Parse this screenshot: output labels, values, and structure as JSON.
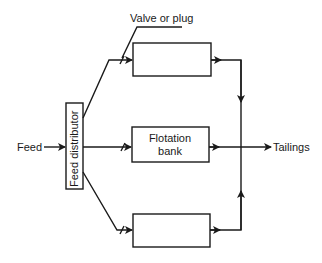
{
  "diagram": {
    "type": "flowsheet",
    "labels": {
      "feed": "Feed",
      "distributor": "Feed distributor",
      "valve": "Valve or plug",
      "bank_line1": "Flotation",
      "bank_line2": "bank",
      "tailings": "Tailings"
    },
    "nodes": [
      {
        "id": "feed",
        "label": "Feed"
      },
      {
        "id": "distributor",
        "label": "Feed distributor"
      },
      {
        "id": "bank_top",
        "label": ""
      },
      {
        "id": "bank_middle",
        "label": "Flotation bank"
      },
      {
        "id": "bank_bottom",
        "label": ""
      },
      {
        "id": "tailings",
        "label": "Tailings"
      }
    ],
    "edges": [
      {
        "from": "feed",
        "to": "distributor"
      },
      {
        "from": "distributor",
        "to": "bank_top",
        "via": "valve"
      },
      {
        "from": "distributor",
        "to": "bank_middle",
        "via": "valve"
      },
      {
        "from": "distributor",
        "to": "bank_bottom",
        "via": "valve"
      },
      {
        "from": "bank_top",
        "to": "tailings"
      },
      {
        "from": "bank_middle",
        "to": "tailings"
      },
      {
        "from": "bank_bottom",
        "to": "tailings"
      }
    ],
    "colors": {
      "line": "#1a1a1a",
      "background": "#ffffff"
    }
  }
}
